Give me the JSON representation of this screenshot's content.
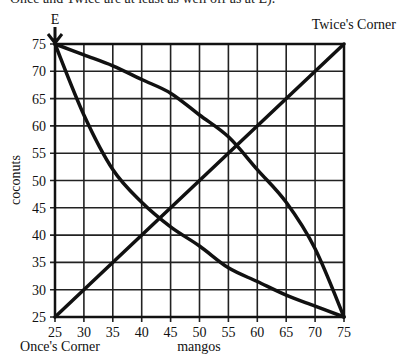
{
  "header_clipped_text": "Once and Twice are at least as well off as at E).",
  "chart_data": {
    "type": "line",
    "title": "",
    "xlabel": "mangos",
    "ylabel": "coconuts",
    "xlim": [
      25,
      75
    ],
    "ylim": [
      25,
      75
    ],
    "grid": true,
    "x_ticks": [
      25,
      30,
      35,
      40,
      45,
      50,
      55,
      60,
      65,
      70,
      75
    ],
    "y_ticks": [
      25,
      30,
      35,
      40,
      45,
      50,
      55,
      60,
      65,
      70,
      75
    ],
    "annotations": [
      {
        "text": "E",
        "x": 25,
        "y": 75,
        "marker": "down-arrow"
      },
      {
        "text": "Twice's Corner",
        "position": "top-right"
      },
      {
        "text": "Once's Corner",
        "position": "bottom-left"
      }
    ],
    "series": [
      {
        "name": "contract curve (diagonal)",
        "x": [
          25,
          75
        ],
        "y": [
          25,
          75
        ]
      },
      {
        "name": "upper indifference curve through E",
        "x": [
          25,
          30,
          35,
          40,
          45,
          50,
          55,
          60,
          65,
          70,
          75
        ],
        "y": [
          75,
          73,
          71,
          68.5,
          66,
          62,
          58,
          52,
          46,
          37.5,
          25
        ]
      },
      {
        "name": "lower indifference curve through E",
        "x": [
          25,
          30,
          35,
          40,
          45,
          50,
          55,
          60,
          65,
          70,
          75
        ],
        "y": [
          75,
          62,
          52,
          46,
          41.5,
          38,
          34,
          31.5,
          29,
          27,
          25
        ]
      }
    ]
  },
  "labels": {
    "e_marker": "E",
    "top_right_corner": "Twice's Corner",
    "bottom_left_corner": "Once's Corner",
    "x_axis": "mangos",
    "y_axis": "coconuts"
  }
}
